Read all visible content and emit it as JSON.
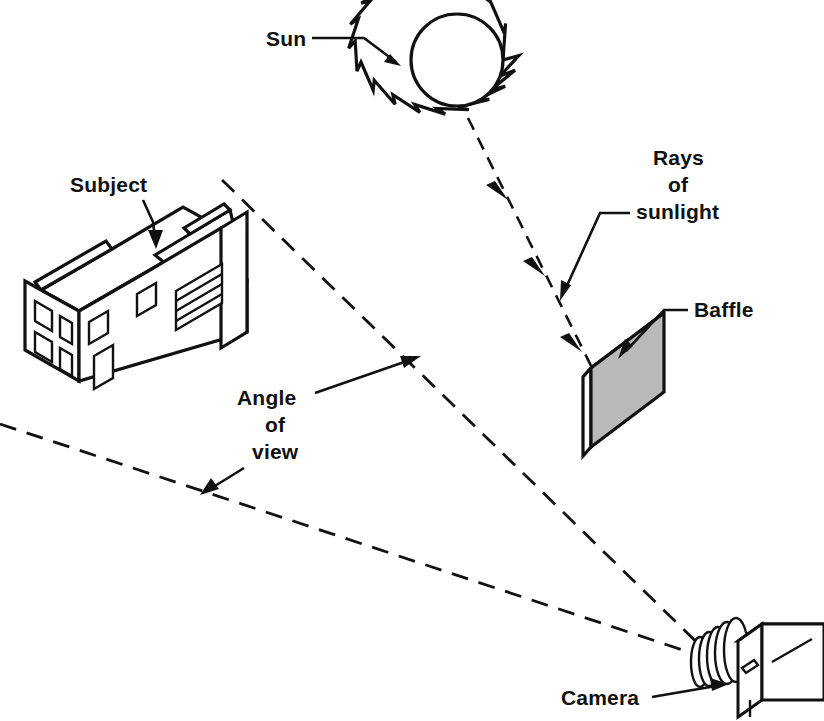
{
  "diagram": {
    "background_color": "#ffffff",
    "ink_color": "#111111",
    "baffle_fill_color": "#b9b9b9",
    "width": 824,
    "height": 721
  },
  "labels": {
    "sun": "Sun",
    "subject": "Subject",
    "rays_line1": "Rays",
    "rays_line2": "of",
    "rays_line3": "sunlight",
    "baffle": "Baffle",
    "angle_line1": "Angle",
    "angle_line2": "of",
    "angle_line3": "view",
    "camera": "Camera"
  },
  "elements": {
    "sun": {
      "name": "sun",
      "shape": "spiked-circle",
      "center_x": 457,
      "center_y": 60,
      "radius": 46,
      "spike_count": 18,
      "spike_length": 14
    },
    "subject": {
      "name": "house",
      "shape": "isometric-house",
      "window_count": 8,
      "door_count": 1,
      "garage_door_lines": 3
    },
    "baffle": {
      "name": "baffle-panel",
      "shape": "parallelogram-panel-3d",
      "fill": "#b9b9b9",
      "center_x": 622,
      "center_y": 390
    },
    "camera": {
      "name": "camera",
      "shape": "box-with-bellows-lens",
      "bellows_rings": 5,
      "body_center_x": 765,
      "body_center_y": 655
    },
    "sunlight_ray": {
      "name": "sunlight-ray",
      "style": "dashed",
      "arrowheads": 3,
      "from_x": 468,
      "from_y": 120,
      "to_x": 608,
      "to_y": 400
    },
    "view_cone": {
      "name": "angle-of-view",
      "style": "dashed",
      "apex_x": 716,
      "apex_y": 661,
      "upper_end_x": 222,
      "upper_end_y": 180,
      "lower_end_x": 0,
      "lower_end_y": 424
    }
  }
}
